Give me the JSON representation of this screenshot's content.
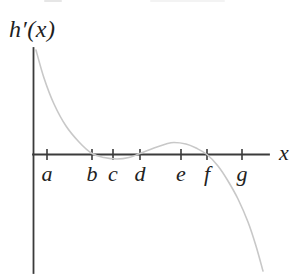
{
  "figure": {
    "title": "h′(x)",
    "x_axis_label": "x",
    "background_color": "#ffffff"
  },
  "axis": {
    "color": "#3b3b3b",
    "ticks": [
      {
        "label": "a",
        "x": 47
      },
      {
        "label": "b",
        "x": 92
      },
      {
        "label": "c",
        "x": 113
      },
      {
        "label": "d",
        "x": 140
      },
      {
        "label": "e",
        "x": 181
      },
      {
        "label": "f",
        "x": 207
      },
      {
        "label": "g",
        "x": 242
      }
    ]
  },
  "chart_data": {
    "type": "line",
    "title": "h′(x)",
    "xlabel": "x",
    "ylabel": "",
    "x_tick_labels": [
      "a",
      "b",
      "c",
      "d",
      "e",
      "f",
      "g"
    ],
    "axes_numeric": false,
    "grid": false,
    "legend": false,
    "curve_color": "#c8c8c8",
    "axis_color": "#3b3b3b",
    "zeros_at_ticks": [
      "b",
      "d",
      "f"
    ],
    "sign_pattern": "h′(x) starts high near the vertical axis and decreases steeply (concave up) to reach the x-axis at b; it stays slightly below the axis on (b, d) with a shallow minimum between c and d; rises slightly above the axis on (d, f) with a small local maximum just before e; crosses the axis at f and decreases steeply toward the lower right.",
    "series": [
      {
        "name": "h′(x)",
        "points_px": [
          [
            36,
            50
          ],
          [
            44,
            78
          ],
          [
            54,
            104
          ],
          [
            66,
            126
          ],
          [
            79,
            142
          ],
          [
            92,
            153.5
          ],
          [
            104,
            157.5
          ],
          [
            117,
            159
          ],
          [
            129,
            157.5
          ],
          [
            140,
            153.5
          ],
          [
            154,
            148
          ],
          [
            166,
            144
          ],
          [
            174,
            142.5
          ],
          [
            186,
            144
          ],
          [
            196,
            148
          ],
          [
            207,
            154.5
          ],
          [
            218,
            166
          ],
          [
            228,
            181
          ],
          [
            238,
            199
          ],
          [
            248,
            222
          ],
          [
            256,
            246
          ],
          [
            263,
            271
          ]
        ]
      }
    ]
  }
}
